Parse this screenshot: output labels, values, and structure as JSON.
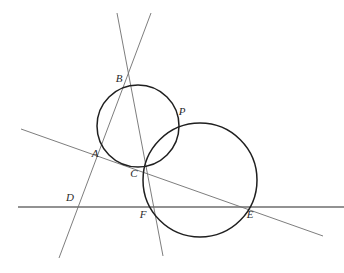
{
  "figure": {
    "width": 344,
    "height": 273,
    "background_color": "#ffffff",
    "stroke_color_circle": "#1f1f1f",
    "stroke_color_line": "#6e6e6e",
    "label_color": "#2a2a2a"
  },
  "points": [
    {
      "id": "A",
      "label": "A",
      "x": 107,
      "y": 152,
      "label_x": 95,
      "label_y": 157
    },
    {
      "id": "B",
      "label": "B",
      "x": 131,
      "y": 85,
      "label_x": 119,
      "label_y": 82
    },
    {
      "id": "C",
      "label": "C",
      "x": 144,
      "y": 166,
      "label_x": 133,
      "label_y": 177
    },
    {
      "id": "D",
      "label": "D",
      "x": 83,
      "y": 207,
      "label_x": 69,
      "label_y": 200
    },
    {
      "id": "E",
      "label": "E",
      "x": 243,
      "y": 207,
      "label_x": 247,
      "label_y": 217
    },
    {
      "id": "F",
      "label": "F",
      "x": 152,
      "y": 207,
      "label_x": 142,
      "label_y": 217
    },
    {
      "id": "P",
      "label": "P",
      "x": 177,
      "y": 119,
      "label_x": 180,
      "label_y": 115
    }
  ],
  "circles": [
    {
      "id": "circle-left",
      "cx": 138,
      "cy": 126,
      "r": 41,
      "stroke_width": 1.5
    },
    {
      "id": "circle-right",
      "cx": 200,
      "cy": 180,
      "r": 57,
      "stroke_width": 1.5
    }
  ],
  "lines": [
    {
      "id": "line-horizontal",
      "x1": 18,
      "y1": 207,
      "x2": 344,
      "y2": 207,
      "stroke_width": 1.3
    },
    {
      "id": "line-transversal-ace",
      "x1": 21,
      "y1": 129,
      "x2": 323,
      "y2": 236,
      "stroke_width": 0.9
    },
    {
      "id": "line-bad",
      "x1": 151,
      "y1": 13,
      "x2": 59,
      "y2": 258,
      "stroke_width": 0.9
    },
    {
      "id": "line-bcf",
      "x1": 117,
      "y1": 13,
      "x2": 163,
      "y2": 256,
      "stroke_width": 0.9
    }
  ]
}
